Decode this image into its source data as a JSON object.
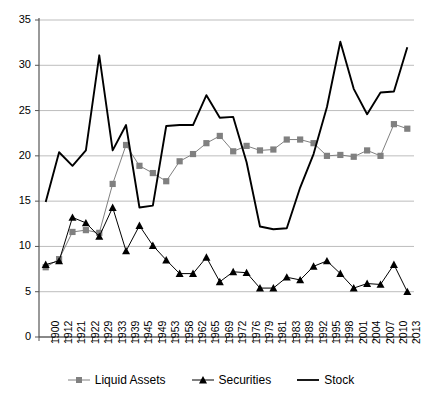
{
  "chart_data": {
    "type": "line",
    "title": "",
    "subtitle": "",
    "xlabel": "",
    "ylabel": "",
    "ylim": [
      0,
      35
    ],
    "yticks": [
      0,
      5,
      10,
      15,
      20,
      25,
      30,
      35
    ],
    "grid": true,
    "legend_position": "bottom",
    "categories": [
      "1900",
      "1912",
      "1921",
      "1922",
      "1929",
      "1933",
      "1939",
      "1945",
      "1949",
      "1953",
      "1958",
      "1962",
      "1965",
      "1969",
      "1972",
      "1976",
      "1979",
      "1981",
      "1983",
      "1989",
      "1992",
      "1995",
      "1998",
      "2001",
      "2004",
      "2007",
      "2010",
      "2013"
    ],
    "series": [
      {
        "name": "Liquid Assets",
        "marker": "square",
        "color": "#808080",
        "values": [
          7.7,
          8.6,
          11.6,
          11.8,
          11.5,
          16.9,
          21.2,
          18.9,
          18.1,
          17.2,
          19.4,
          20.2,
          21.4,
          22.2,
          20.5,
          21.1,
          20.6,
          20.7,
          21.8,
          21.8,
          21.4,
          20.0,
          20.1,
          19.9,
          20.6,
          20.0,
          23.5,
          23.0
        ]
      },
      {
        "name": "Securities",
        "marker": "triangle",
        "color": "#000000",
        "values": [
          8.0,
          8.4,
          13.2,
          12.6,
          11.1,
          14.3,
          9.5,
          12.3,
          10.1,
          8.5,
          7.0,
          7.0,
          8.8,
          6.1,
          7.2,
          7.1,
          5.4,
          5.4,
          6.6,
          6.3,
          7.8,
          8.4,
          7.0,
          5.4,
          5.9,
          5.8,
          8.0,
          5.0
        ]
      },
      {
        "name": "Stock",
        "marker": "none",
        "color": "#000000",
        "values": [
          14.9,
          20.4,
          18.9,
          20.6,
          31.1,
          20.6,
          23.4,
          14.3,
          14.5,
          23.3,
          23.4,
          23.4,
          26.7,
          24.2,
          24.3,
          19.3,
          12.2,
          11.9,
          12.0,
          16.5,
          20.2,
          25.4,
          32.6,
          27.4,
          24.6,
          27.0,
          27.1,
          32.0
        ]
      }
    ]
  },
  "legend": {
    "items": [
      {
        "label": "Liquid Assets",
        "marker": "square"
      },
      {
        "label": "Securities",
        "marker": "triangle"
      },
      {
        "label": "Stock",
        "marker": "line"
      }
    ]
  }
}
